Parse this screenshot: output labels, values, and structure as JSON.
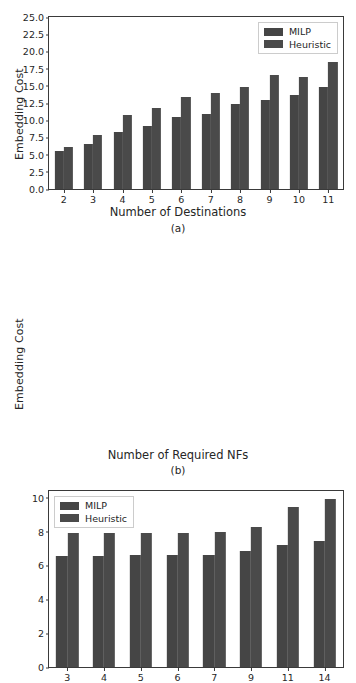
{
  "figure": {
    "background": "#ffffff",
    "bar_colors": [
      "#454545",
      "#4a4a4a"
    ],
    "axis_color": "#3a3a3a"
  },
  "chart_data": [
    {
      "type": "bar",
      "panel": "(a)",
      "title": "",
      "xlabel": "Number of Destinations",
      "ylabel": "Embedding Cost",
      "categories": [
        "2",
        "3",
        "4",
        "5",
        "6",
        "7",
        "8",
        "9",
        "10",
        "11"
      ],
      "series": [
        {
          "name": "MILP",
          "values": [
            5.5,
            6.5,
            8.3,
            9.1,
            10.4,
            10.9,
            12.3,
            13.0,
            13.6,
            14.8
          ]
        },
        {
          "name": "Heuristic",
          "values": [
            6.1,
            7.9,
            10.8,
            11.8,
            13.35,
            14.0,
            14.9,
            16.6,
            16.35,
            18.5
          ]
        }
      ],
      "ylim": [
        0,
        25
      ],
      "yticks": [
        "0.0",
        "2.5",
        "5.0",
        "7.5",
        "10.0",
        "12.5",
        "15.0",
        "17.5",
        "20.0",
        "22.5",
        "25.0"
      ],
      "ytick_values": [
        0,
        2.5,
        5,
        7.5,
        10,
        12.5,
        15,
        17.5,
        20,
        22.5,
        25
      ],
      "grid": false,
      "legend_position": "upper right"
    },
    {
      "type": "bar",
      "panel": "(b)",
      "title": "",
      "xlabel": "Number of Required NFs",
      "ylabel": "Embedding Cost",
      "categories": [
        "3",
        "4",
        "5",
        "6",
        "7",
        "9",
        "11",
        "14"
      ],
      "series": [
        {
          "name": "MILP",
          "values": [
            6.55,
            6.57,
            6.6,
            6.6,
            6.63,
            6.85,
            7.2,
            7.45
          ]
        },
        {
          "name": "Heuristic",
          "values": [
            7.93,
            7.93,
            7.93,
            7.93,
            7.95,
            8.25,
            9.45,
            9.9
          ]
        }
      ],
      "ylim": [
        0,
        10.4
      ],
      "yticks": [
        "0",
        "2",
        "4",
        "6",
        "8",
        "10"
      ],
      "ytick_values": [
        0,
        2,
        4,
        6,
        8,
        10
      ],
      "grid": false,
      "legend_position": "upper left"
    }
  ]
}
